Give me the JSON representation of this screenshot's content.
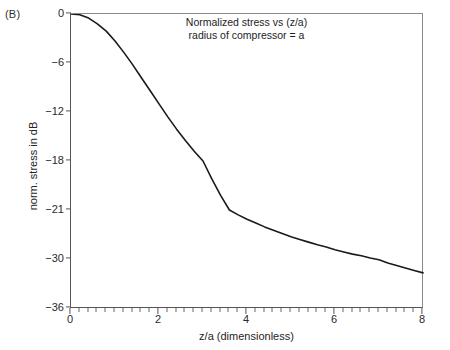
{
  "figure": {
    "panel_label": "(B)",
    "title_line1": "Normalized stress vs (z/a)",
    "title_line2": "radius of compressor = a",
    "xlabel": "z/a (dimensionless)",
    "ylabel": "norm. stress in dB",
    "curve_color": "#1a1a1a",
    "axis_color": "#555555",
    "background": "#ffffff"
  },
  "chart_data": {
    "type": "line",
    "xlabel": "z/a (dimensionless)",
    "ylabel": "norm. stress in dB",
    "xlim": [
      0,
      8
    ],
    "ylim": [
      -36,
      0
    ],
    "xticks": [
      0,
      2,
      4,
      6,
      8
    ],
    "xticklabels": [
      "0",
      "2",
      "4",
      "6",
      "8"
    ],
    "yticks": [
      0,
      -6,
      -12,
      -18,
      -21,
      -30,
      -36
    ],
    "yticklabels": [
      "0",
      "−6",
      "−12",
      "−18",
      "−21",
      "−30",
      "−36"
    ],
    "ytick_note": "tick labels are evenly spaced on the axis though the printed sequence 0,-6,-12,-18,-21,-30,-36 is non-uniform (as in the original figure)",
    "grid": false,
    "legend": null,
    "minor_ticks": {
      "x_interval": 0.2,
      "y": false
    },
    "series": [
      {
        "name": "normalized stress",
        "x": [
          0.0,
          0.2,
          0.4,
          0.6,
          0.8,
          1.0,
          1.2,
          1.4,
          1.6,
          1.8,
          2.0,
          2.2,
          2.4,
          2.6,
          2.8,
          3.0,
          3.2,
          3.4,
          3.6,
          3.8,
          4.0,
          4.2,
          4.4,
          4.6,
          4.8,
          5.0,
          5.2,
          5.4,
          5.6,
          5.8,
          6.0,
          6.2,
          6.4,
          6.6,
          6.8,
          7.0,
          7.2,
          7.4,
          7.6,
          7.8,
          8.0
        ],
        "y": [
          0.0,
          -0.1,
          -0.5,
          -1.2,
          -2.1,
          -3.3,
          -4.7,
          -6.2,
          -7.8,
          -9.4,
          -11.0,
          -12.6,
          -14.1,
          -15.5,
          -16.8,
          -18.0,
          -19.1,
          -20.1,
          -21.0,
          -21.9,
          -22.7,
          -23.4,
          -24.1,
          -24.7,
          -25.3,
          -25.9,
          -26.4,
          -26.9,
          -27.4,
          -27.8,
          -28.3,
          -28.7,
          -29.1,
          -29.4,
          -29.8,
          -30.1,
          -30.5,
          -30.8,
          -31.1,
          -31.4,
          -31.7
        ]
      }
    ],
    "annotations": [
      {
        "text": "Normalized stress vs (z/a)",
        "position": "top-center"
      },
      {
        "text": "radius of compressor = a",
        "position": "top-center"
      },
      {
        "text": "(B)",
        "position": "outside-top-left"
      }
    ]
  }
}
